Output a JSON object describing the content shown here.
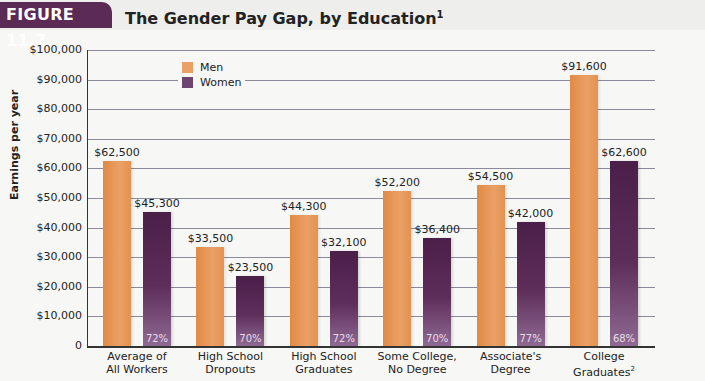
{
  "header": {
    "figure_label": "FIGURE 11.7",
    "title": "The Gender Pay Gap, by Education",
    "title_superscript": "1"
  },
  "chart_data": {
    "type": "bar",
    "title": "The Gender Pay Gap, by Education",
    "xlabel": "",
    "ylabel": "Earnings per year",
    "ylim": [
      0,
      100000
    ],
    "yticks": [
      "0",
      "$10,000",
      "$20,000",
      "$30,000",
      "$40,000",
      "$50,000",
      "$60,000",
      "$70,000",
      "$80,000",
      "$90,000",
      "$100,000"
    ],
    "grid": true,
    "legend_position": "top-left inside",
    "categories": [
      "Average of All Workers",
      "High School Dropouts",
      "High School Graduates",
      "Some College, No Degree",
      "Associate's Degree",
      "College Graduates"
    ],
    "category_lines": [
      [
        "Average of",
        "All Workers",
        ""
      ],
      [
        "High School",
        "Dropouts",
        ""
      ],
      [
        "High School",
        "Graduates",
        ""
      ],
      [
        "Some College,",
        "No Degree",
        ""
      ],
      [
        "Associate's",
        "Degree",
        ""
      ],
      [
        "College",
        "Graduates",
        "2"
      ]
    ],
    "series": [
      {
        "name": "Men",
        "color": "#e8914e",
        "values": [
          62500,
          33500,
          44300,
          52200,
          54500,
          91600
        ],
        "labels": [
          "$62,500",
          "$33,500",
          "$44,300",
          "$52,200",
          "$54,500",
          "$91,600"
        ]
      },
      {
        "name": "Women",
        "color": "#5a2a56",
        "values": [
          45300,
          23500,
          32100,
          36400,
          42000,
          62600
        ],
        "labels": [
          "$45,300",
          "$23,500",
          "$32,100",
          "$36,400",
          "$42,000",
          "$62,600"
        ]
      }
    ],
    "ratios": [
      "72%",
      "70%",
      "72%",
      "70%",
      "77%",
      "68%"
    ]
  }
}
